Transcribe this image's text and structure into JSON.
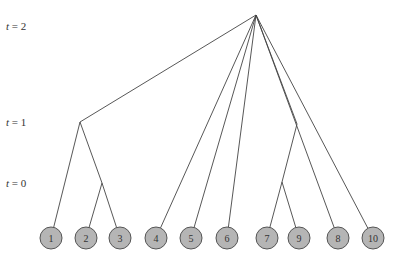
{
  "diagram": {
    "type": "dendrogram",
    "time_labels": [
      {
        "var": "t",
        "value": "2",
        "text": "t = 2",
        "x": 6,
        "y": 27
      },
      {
        "var": "t",
        "value": "1",
        "text": "t = 1",
        "x": 6,
        "y": 123
      },
      {
        "var": "t",
        "value": "0",
        "text": "t = 0",
        "x": 6,
        "y": 184
      }
    ],
    "colors": {
      "line": "#444444",
      "node_fill": "#b5b5b5",
      "node_stroke": "#555555",
      "node_text": "#333333"
    },
    "root": {
      "x": 256,
      "y": 15
    },
    "junctions": [
      {
        "id": "j_left",
        "x": 80,
        "y": 122
      },
      {
        "id": "j_23",
        "x": 102,
        "y": 183
      },
      {
        "id": "j_right",
        "x": 297,
        "y": 124
      },
      {
        "id": "j_79",
        "x": 282,
        "y": 182
      }
    ],
    "leaves": [
      {
        "label": "1",
        "x": 51,
        "y": 238
      },
      {
        "label": "2",
        "x": 86,
        "y": 238
      },
      {
        "label": "3",
        "x": 120,
        "y": 238
      },
      {
        "label": "4",
        "x": 156,
        "y": 238
      },
      {
        "label": "5",
        "x": 191,
        "y": 238
      },
      {
        "label": "6",
        "x": 227,
        "y": 238
      },
      {
        "label": "7",
        "x": 267,
        "y": 238
      },
      {
        "label": "9",
        "x": 299,
        "y": 238
      },
      {
        "label": "8",
        "x": 338,
        "y": 238
      },
      {
        "label": "10",
        "x": 373,
        "y": 238
      }
    ],
    "edges": [
      [
        "root",
        "j_left"
      ],
      [
        "root",
        "4"
      ],
      [
        "root",
        "5"
      ],
      [
        "root",
        "6"
      ],
      [
        "root",
        "j_right"
      ],
      [
        "root",
        "8"
      ],
      [
        "root",
        "10"
      ],
      [
        "j_left",
        "1"
      ],
      [
        "j_left",
        "j_23"
      ],
      [
        "j_23",
        "2"
      ],
      [
        "j_23",
        "3"
      ],
      [
        "j_right",
        "j_79"
      ],
      [
        "j_right",
        "8_skip"
      ],
      [
        "j_79",
        "7"
      ],
      [
        "j_79",
        "9"
      ]
    ]
  }
}
